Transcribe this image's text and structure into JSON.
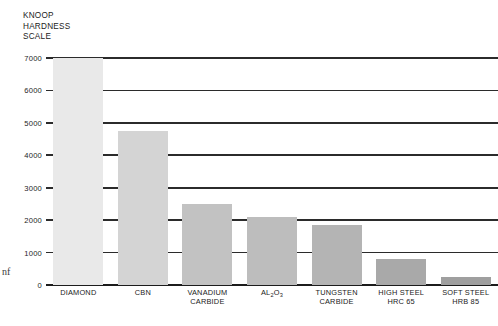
{
  "chart_data": {
    "type": "bar",
    "title": "KNOOP\nHARDNESS\nSCALE",
    "title_lines": [
      "KNOOP",
      "HARDNESS",
      "SCALE"
    ],
    "xlabel": "",
    "ylabel": "KNOOP HARDNESS SCALE",
    "ylim": [
      0,
      7000
    ],
    "yticks": [
      0,
      1000,
      2000,
      3000,
      4000,
      5000,
      6000,
      7000
    ],
    "ytick_labels": [
      "0",
      "1000",
      "2000",
      "3000",
      "4000",
      "5000",
      "6000",
      "7000"
    ],
    "grid": true,
    "legend": null,
    "categories": [
      "DIAMOND",
      "CBN",
      "VANADIUM\nCARBIDE",
      "AL2O3",
      "TUNGSTEN\nCARBIDE",
      "HIGH STEEL\nHRC 65",
      "SOFT STEEL\nHRB 85"
    ],
    "values": [
      7000,
      4750,
      2500,
      2100,
      1850,
      800,
      250
    ],
    "bar_colors": [
      "#e9e9e9",
      "#d4d4d4",
      "#c2c2c2",
      "#bdbdbd",
      "#b4b4b4",
      "#a9a9a9",
      "#9f9f9f"
    ],
    "bars": [
      {
        "label": "DIAMOND",
        "label_line1": "DIAMOND",
        "label_line2": "",
        "value": 7000,
        "color": "#e9e9e9"
      },
      {
        "label": "CBN",
        "label_line1": "CBN",
        "label_line2": "",
        "value": 4750,
        "color": "#d4d4d4"
      },
      {
        "label": "VANADIUM CARBIDE",
        "label_line1": "VANADIUM",
        "label_line2": "CARBIDE",
        "value": 2500,
        "color": "#c2c2c2"
      },
      {
        "label": "AL2O3",
        "label_line1": "AL2O3",
        "label_line2": "",
        "value": 2100,
        "color": "#bdbdbd"
      },
      {
        "label": "TUNGSTEN CARBIDE",
        "label_line1": "TUNGSTEN",
        "label_line2": "CARBIDE",
        "value": 1850,
        "color": "#b4b4b4"
      },
      {
        "label": "HIGH STEEL HRC 65",
        "label_line1": "HIGH STEEL",
        "label_line2": "HRC 65",
        "value": 800,
        "color": "#a9a9a9"
      },
      {
        "label": "SOFT STEEL HRB 85",
        "label_line1": "SOFT STEEL",
        "label_line2": "HRB 85",
        "value": 250,
        "color": "#9f9f9f"
      }
    ]
  },
  "artifact": {
    "edge_text": "nf"
  }
}
